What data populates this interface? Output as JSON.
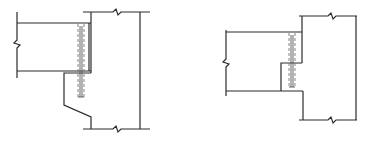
{
  "diagram": {
    "title": "",
    "colors": {
      "line": "#2a2a2a",
      "rebar": "#777777",
      "background": "#ffffff"
    },
    "figures": [
      {
        "id": "left",
        "name": "beam-on-sloped-corbel",
        "label": ""
      },
      {
        "id": "right",
        "name": "dapped-beam-on-stepped-column",
        "label": ""
      }
    ]
  }
}
